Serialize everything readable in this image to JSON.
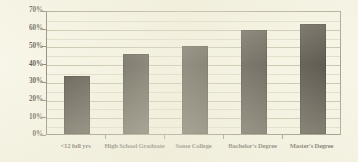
{
  "chart_data": {
    "type": "bar",
    "title": "",
    "subtitle": "",
    "xlabel": "",
    "ylabel": "",
    "categories": [
      "<12 full yrs",
      "High School Graduate",
      "Some College",
      "Bachelor's Degree",
      "Master's Degree"
    ],
    "values": [
      33,
      45,
      49.5,
      59,
      62
    ],
    "value_labels": [
      "33%",
      "45%",
      "49.5%",
      "59%",
      "62%"
    ],
    "ylim": [
      0,
      70
    ],
    "ytick_values": [
      0,
      10,
      20,
      30,
      40,
      50,
      60,
      70
    ],
    "ytick_labels": [
      "0%",
      "10%",
      "20%",
      "30%",
      "40%",
      "50%",
      "60%",
      "70%"
    ],
    "yminor_values": [
      5,
      15,
      25,
      35,
      45,
      55,
      65
    ],
    "grid": true,
    "legend": false,
    "legend_position": "none",
    "series": [
      {
        "name": "",
        "values": [
          33,
          45,
          49.5,
          59,
          62
        ]
      }
    ]
  },
  "style": {
    "background_color": "#f8f6e8",
    "bar_color": "#241f18",
    "gridline_color": "#b9b49a",
    "minor_gridline_color": "#d9d5bd",
    "axis_color": "#6b6550",
    "text_color": "#2b2820"
  }
}
